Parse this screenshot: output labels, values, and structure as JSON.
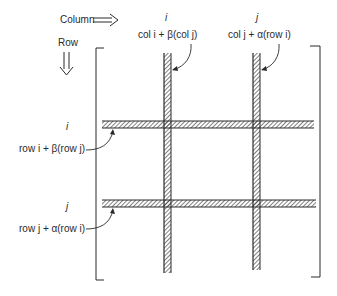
{
  "diagram": {
    "type": "matrix-row-column-operation",
    "header": {
      "column_label": "Column",
      "row_label": "Row"
    },
    "column_indices": [
      {
        "index": "i",
        "operation": "col i + β(col j)"
      },
      {
        "index": "j",
        "operation": "col j + α(row i)"
      }
    ],
    "row_indices": [
      {
        "index": "i",
        "operation": "row i + β(row j)"
      },
      {
        "index": "j",
        "operation": "row j + α(row i)"
      }
    ],
    "colors": {
      "line": "#2a2a2a",
      "background": "#ffffff"
    }
  }
}
